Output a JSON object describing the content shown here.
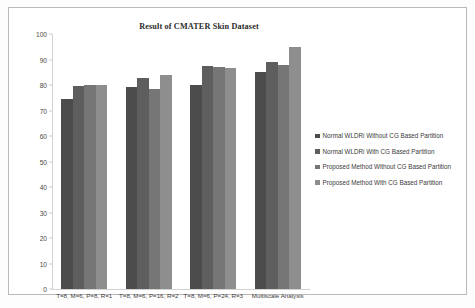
{
  "chart_data": {
    "type": "bar",
    "title": "Result of CMATER Skin Dataset",
    "xlabel": "",
    "ylabel": "",
    "ylim": [
      0,
      100
    ],
    "ytick_step": 10,
    "yticks": [
      "100",
      "90",
      "80",
      "70",
      "60",
      "50",
      "40",
      "30",
      "20",
      "10",
      "0"
    ],
    "grid": false,
    "legend_position": "right",
    "categories": [
      "T=8, M=6, P=8, R=1",
      "T=8, M=6, P=16, R=2",
      "T=8, M=6, P=24, R=3",
      "Multiscale Analysis"
    ],
    "series": [
      {
        "name": "Normal WLDRi Without CG Based Partition",
        "color": "#4c4c4c",
        "values": [
          74.5,
          79.3,
          80.0,
          85.2
        ]
      },
      {
        "name": "Normal WLDRi With CG Based Partition",
        "color": "#5e5e5e",
        "values": [
          79.5,
          82.8,
          87.5,
          89.2
        ]
      },
      {
        "name": "Proposed Method Without CG Based Partition",
        "color": "#767676",
        "values": [
          80.2,
          78.3,
          87.0,
          88.0
        ]
      },
      {
        "name": "Proposed Method With CG Based Partition",
        "color": "#8e8e8e",
        "values": [
          80.2,
          83.8,
          86.8,
          94.8
        ]
      }
    ]
  },
  "legend": {
    "items": [
      {
        "label": "Normal WLDRi Without CG Based Partition",
        "color": "#4c4c4c"
      },
      {
        "label": "Normal WLDRi With CG Based Partition",
        "color": "#5e5e5e"
      },
      {
        "label": "Proposed Method Without CG Based Partition",
        "color": "#767676"
      },
      {
        "label": "Proposed Method With CG Based Partition",
        "color": "#8e8e8e"
      }
    ]
  }
}
